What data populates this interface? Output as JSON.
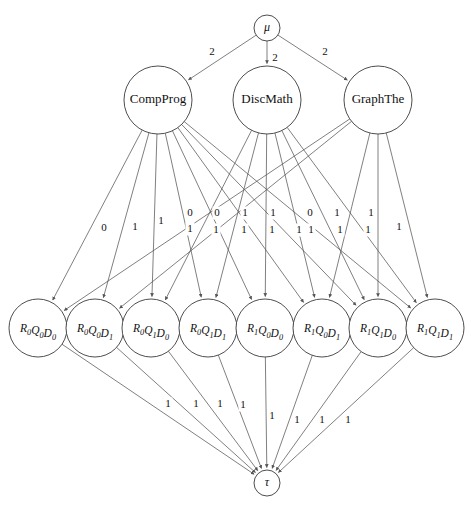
{
  "diagram": {
    "type": "flow-network",
    "colors": {
      "node_stroke": "#3a3a3a",
      "edge_stroke": "#555555",
      "background": "#ffffff",
      "text": "#111111"
    },
    "source": {
      "id": "mu",
      "label": "μ",
      "cx": 267,
      "cy": 28,
      "r": 13
    },
    "sink": {
      "id": "tau",
      "label": "τ",
      "cx": 267,
      "cy": 483,
      "r": 13
    },
    "courses": [
      {
        "id": "compprog",
        "label": "CompProg",
        "cx": 158,
        "cy": 100,
        "r": 34
      },
      {
        "id": "discmath",
        "label": "DiscMath",
        "cx": 267,
        "cy": 100,
        "r": 34
      },
      {
        "id": "graphthe",
        "label": "GraphThe",
        "cx": 378,
        "cy": 100,
        "r": 34
      }
    ],
    "states": [
      {
        "id": "r0q0d0",
        "base": "R",
        "s1": "0",
        "b2": "Q",
        "s2": "0",
        "b3": "D",
        "s3": "0",
        "cx": 38,
        "cy": 328,
        "r": 29
      },
      {
        "id": "r0q0d1",
        "base": "R",
        "s1": "0",
        "b2": "Q",
        "s2": "0",
        "b3": "D",
        "s3": "1",
        "cx": 95,
        "cy": 328,
        "r": 29
      },
      {
        "id": "r0q1d0",
        "base": "R",
        "s1": "0",
        "b2": "Q",
        "s2": "1",
        "b3": "D",
        "s3": "0",
        "cx": 151,
        "cy": 328,
        "r": 29
      },
      {
        "id": "r0q1d1",
        "base": "R",
        "s1": "0",
        "b2": "Q",
        "s2": "1",
        "b3": "D",
        "s3": "1",
        "cx": 208,
        "cy": 328,
        "r": 29
      },
      {
        "id": "r1q0d0",
        "base": "R",
        "s1": "1",
        "b2": "Q",
        "s2": "0",
        "b3": "D",
        "s3": "0",
        "cx": 265,
        "cy": 328,
        "r": 29
      },
      {
        "id": "r1q0d1",
        "base": "R",
        "s1": "1",
        "b2": "Q",
        "s2": "0",
        "b3": "D",
        "s3": "1",
        "cx": 322,
        "cy": 328,
        "r": 29
      },
      {
        "id": "r1q1d0",
        "base": "R",
        "s1": "1",
        "b2": "Q",
        "s2": "1",
        "b3": "D",
        "s3": "0",
        "cx": 378,
        "cy": 328,
        "r": 29
      },
      {
        "id": "r1q1d1",
        "base": "R",
        "s1": "1",
        "b2": "Q",
        "s2": "1",
        "b3": "D",
        "s3": "1",
        "cx": 435,
        "cy": 328,
        "r": 29
      }
    ],
    "source_edges": [
      {
        "from": "mu",
        "to": "compprog",
        "label": "2",
        "lx": 212,
        "ly": 52
      },
      {
        "from": "mu",
        "to": "discmath",
        "label": "2",
        "lx": 275,
        "ly": 58
      },
      {
        "from": "mu",
        "to": "graphthe",
        "label": "2",
        "lx": 325,
        "ly": 52
      }
    ],
    "middle_edges": [
      {
        "from": "compprog",
        "to": "r0q0d0",
        "label": "0",
        "lx": 104,
        "ly": 228
      },
      {
        "from": "compprog",
        "to": "r0q0d1",
        "label": "1",
        "lx": 135,
        "ly": 227
      },
      {
        "from": "compprog",
        "to": "r0q1d0",
        "label": "1",
        "lx": 161,
        "ly": 221
      },
      {
        "from": "compprog",
        "to": "r0q1d1",
        "label": "1",
        "lx": 190,
        "ly": 229
      },
      {
        "from": "compprog",
        "to": "r1q0d0",
        "label": "1",
        "lx": 216,
        "ly": 230
      },
      {
        "from": "compprog",
        "to": "r1q0d1",
        "label": "1",
        "lx": 244,
        "ly": 230
      },
      {
        "from": "compprog",
        "to": "r1q1d0",
        "label": "1",
        "lx": 272,
        "ly": 230
      },
      {
        "from": "compprog",
        "to": "r1q1d1",
        "label": "1",
        "lx": 299,
        "ly": 230
      },
      {
        "from": "discmath",
        "to": "r0q1d0",
        "label": "0",
        "lx": 190,
        "ly": 213
      },
      {
        "from": "discmath",
        "to": "r0q1d1",
        "label": "0",
        "lx": 217,
        "ly": 213
      },
      {
        "from": "discmath",
        "to": "r1q0d0",
        "label": "1",
        "lx": 245,
        "ly": 213
      },
      {
        "from": "discmath",
        "to": "r1q0d1",
        "label": "1",
        "lx": 273,
        "ly": 213
      },
      {
        "from": "discmath",
        "to": "r1q1d0",
        "label": "0",
        "lx": 310,
        "ly": 213
      },
      {
        "from": "discmath",
        "to": "r1q1d1",
        "label": "1",
        "lx": 337,
        "ly": 213
      },
      {
        "from": "graphthe",
        "to": "r1q0d1",
        "label": "1",
        "lx": 311,
        "ly": 230
      },
      {
        "from": "graphthe",
        "to": "r1q1d0",
        "label": "1",
        "lx": 340,
        "ly": 230
      },
      {
        "from": "graphthe",
        "to": "r1q1d1",
        "label": "1",
        "lx": 368,
        "ly": 230
      },
      {
        "from": "graphthe",
        "to": "r0q0d0",
        "label": "1",
        "lx": 371,
        "ly": 213
      },
      {
        "from": "graphthe",
        "to": "r0q0d1",
        "label": "1",
        "lx": 399,
        "ly": 227
      }
    ],
    "sink_edges": [
      {
        "from": "r0q0d0",
        "to": "tau",
        "label": "1",
        "lx": 168,
        "ly": 404
      },
      {
        "from": "r0q0d1",
        "to": "tau",
        "label": "1",
        "lx": 196,
        "ly": 404
      },
      {
        "from": "r0q1d0",
        "to": "tau",
        "label": "1",
        "lx": 220,
        "ly": 404
      },
      {
        "from": "r0q1d1",
        "to": "tau",
        "label": "1",
        "lx": 243,
        "ly": 405
      },
      {
        "from": "r1q0d0",
        "to": "tau",
        "label": "1",
        "lx": 272,
        "ly": 416
      },
      {
        "from": "r1q0d1",
        "to": "tau",
        "label": "1",
        "lx": 297,
        "ly": 420
      },
      {
        "from": "r1q1d0",
        "to": "tau",
        "label": "1",
        "lx": 322,
        "ly": 420
      },
      {
        "from": "r1q1d1",
        "to": "tau",
        "label": "1",
        "lx": 348,
        "ly": 420
      }
    ]
  }
}
